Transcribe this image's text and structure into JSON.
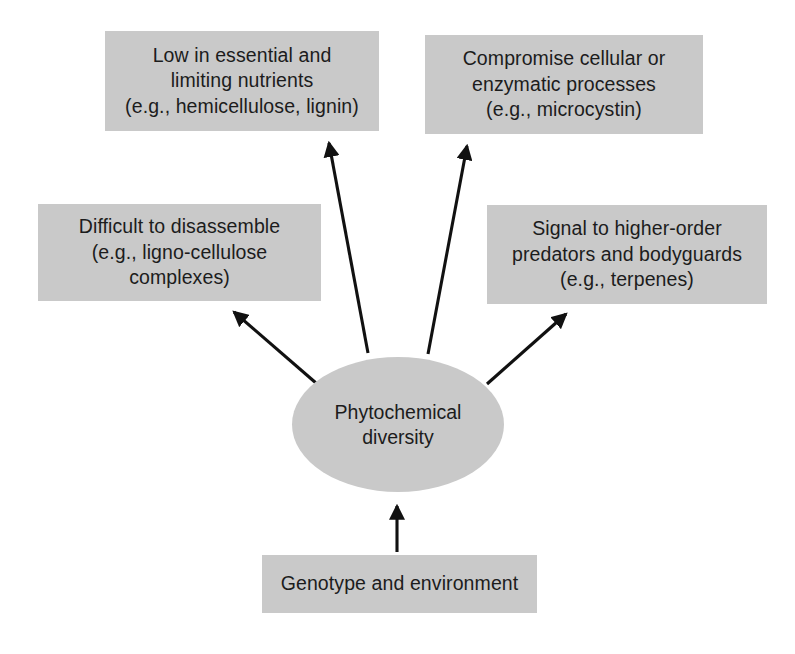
{
  "diagram": {
    "center": {
      "label": "Phytochemical\ndiversity",
      "shape": "ellipse",
      "fill": "#c9c9c9"
    },
    "nodes": [
      {
        "id": "nutrients",
        "label": "Low in essential and\nlimiting nutrients\n(e.g., hemicellulose, lignin)",
        "position": "top-left",
        "fill": "#c9c9c9"
      },
      {
        "id": "enzymatic",
        "label": "Compromise cellular or\nenzymatic processes\n(e.g., microcystin)",
        "position": "top-right",
        "fill": "#c9c9c9"
      },
      {
        "id": "disassemble",
        "label": "Difficult to disassemble\n(e.g., ligno-cellulose\ncomplexes)",
        "position": "middle-left",
        "fill": "#c9c9c9"
      },
      {
        "id": "signal",
        "label": "Signal to higher-order\npredators and bodyguards\n(e.g., terpenes)",
        "position": "middle-right",
        "fill": "#c9c9c9"
      },
      {
        "id": "genotype",
        "label": "Genotype and environment",
        "position": "bottom",
        "fill": "#c9c9c9"
      }
    ],
    "arrows": [
      {
        "id": "arrow-to-nutrients",
        "from": "center",
        "to": "nutrients",
        "direction": "up-left",
        "color": "#111111"
      },
      {
        "id": "arrow-to-enzymatic",
        "from": "center",
        "to": "enzymatic",
        "direction": "up-right",
        "color": "#111111"
      },
      {
        "id": "arrow-to-disassemble",
        "from": "center",
        "to": "disassemble",
        "direction": "up-left",
        "color": "#111111"
      },
      {
        "id": "arrow-to-signal",
        "from": "center",
        "to": "signal",
        "direction": "up-right",
        "color": "#111111"
      },
      {
        "id": "arrow-to-center",
        "from": "genotype",
        "to": "center",
        "direction": "up",
        "color": "#111111"
      }
    ]
  }
}
